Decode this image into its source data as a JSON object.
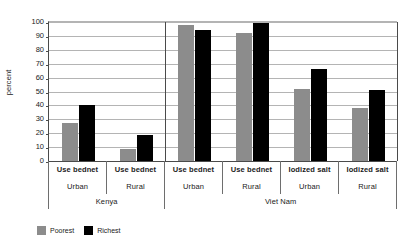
{
  "chart_data": {
    "type": "bar",
    "title": "",
    "xlabel": "",
    "ylabel": "percent",
    "ylim": [
      0,
      100
    ],
    "ytick_values": [
      100,
      90,
      80,
      70,
      60,
      50,
      40,
      30,
      20,
      10,
      0
    ],
    "grid": true,
    "legend_position": "bottom-left",
    "categories": [
      "Use bednet",
      "Use bednet",
      "Use bednet",
      "Use bednet",
      "Iodized salt",
      "Iodized salt"
    ],
    "areas": [
      "Urban",
      "Rural",
      "Urban",
      "Rural",
      "Urban",
      "Rural"
    ],
    "countries": [
      {
        "name": "Kenya",
        "span": 2
      },
      {
        "name": "Viet Nam",
        "span": 4
      }
    ],
    "series": [
      {
        "name": "Poorest",
        "color": "#8c8c8c",
        "values": [
          27,
          9,
          98,
          92,
          52,
          38
        ]
      },
      {
        "name": "Richest",
        "color": "#000000",
        "values": [
          40,
          19,
          94,
          99,
          66,
          51
        ]
      }
    ]
  },
  "colors": {
    "poorest": "#8c8c8c",
    "richest": "#000000",
    "axis": "#4a4a4a",
    "grid": "#b4b4b4",
    "background": "#ffffff"
  }
}
